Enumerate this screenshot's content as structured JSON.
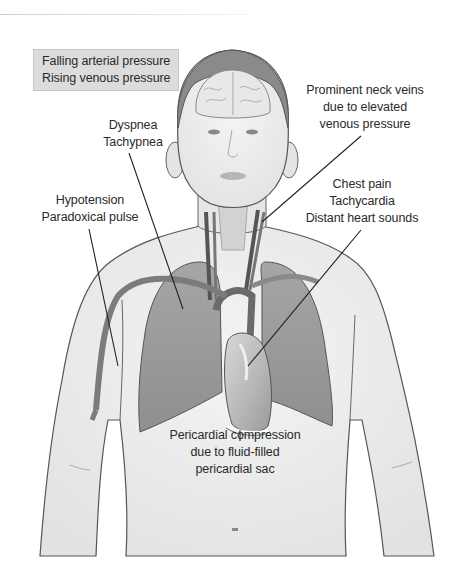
{
  "figure": {
    "colors": {
      "background": "#ffffff",
      "skin": "#ededed",
      "lung": "#9a9a9a",
      "vessel": "#7c7c7c",
      "outline": "#444444",
      "label_box": "#dcdcdc",
      "text": "#2a2a2a"
    }
  },
  "labels": {
    "pressure_box": {
      "line1": "Falling arterial pressure",
      "line2": "Rising venous pressure"
    },
    "neck_veins": {
      "line1": "Prominent neck veins",
      "line2": "due to elevated",
      "line3": "venous pressure"
    },
    "respiratory": {
      "line1": "Dyspnea",
      "line2": "Tachypnea"
    },
    "circulatory": {
      "line1": "Hypotension",
      "line2": "Paradoxical pulse"
    },
    "cardiac": {
      "line1": "Chest pain",
      "line2": "Tachycardia",
      "line3": "Distant heart sounds"
    },
    "pericardial": {
      "line1": "Pericardial compression",
      "line2": "due to fluid-filled",
      "line3": "pericardial sac"
    }
  }
}
